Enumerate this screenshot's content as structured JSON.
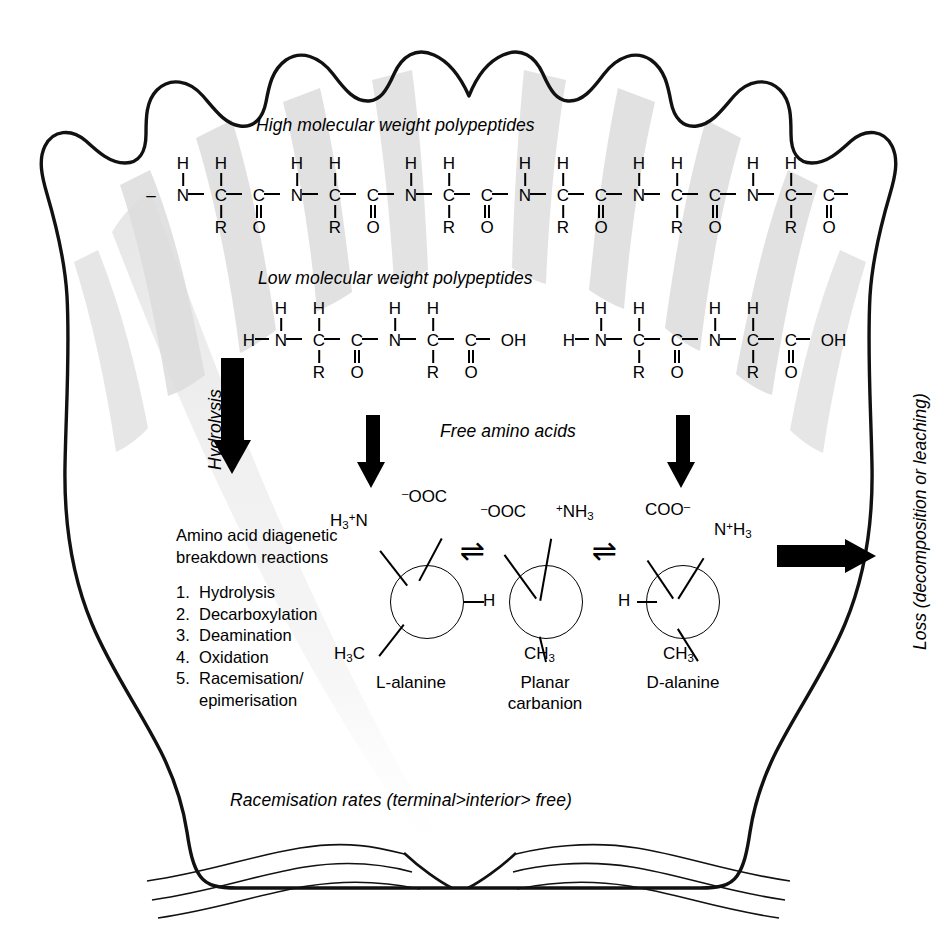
{
  "figure": {
    "title_caption_top": "High molecular weight polypeptides",
    "caption_low_mw": "Low molecular weight polypeptides",
    "caption_free_aa": "Free amino acids",
    "caption_racemisation": "Racemisation rates (terminal>interior> free)",
    "label_hydrolysis": "Hydrolysis",
    "label_loss": "Loss (decomposition or leaching)"
  },
  "reactions": {
    "heading_line1": "Amino acid diagenetic",
    "heading_line2": "breakdown reactions",
    "items": [
      {
        "num": "1.",
        "label": "Hydrolysis"
      },
      {
        "num": "2.",
        "label": "Decarboxylation"
      },
      {
        "num": "3.",
        "label": "Deamination"
      },
      {
        "num": "4.",
        "label": "Oxidation"
      },
      {
        "num": "5.",
        "label": "Racemisation/\nepimerisation"
      }
    ]
  },
  "atoms": {
    "H": "H",
    "N": "N",
    "C": "C",
    "O": "O",
    "R": "R",
    "OH": "OH",
    "dash": "–"
  },
  "structures": {
    "l_alanine": {
      "name": "L-alanine",
      "top_left_group": "H",
      "top_left_sub": "3",
      "top_left_sup": "+",
      "top_left_tail": "N",
      "top_right_sup": "–",
      "top_right_group": "OOC",
      "right_group": "H",
      "bottom_left_group": "H",
      "bottom_left_sub": "3",
      "bottom_left_tail": "C"
    },
    "planar_carbanion": {
      "name_line1": "Planar",
      "name_line2": "carbanion",
      "top_left_sup": "–",
      "top_left_group": "OOC",
      "top_right_sup": "+",
      "top_right_group": "NH",
      "top_right_sub": "3",
      "bottom_group": "CH",
      "bottom_sub": "3"
    },
    "d_alanine": {
      "name": "D-alanine",
      "top_left_group": "COO",
      "top_left_sup": "–",
      "top_right_group": "N",
      "top_right_sup": "+",
      "top_right_tail": "H",
      "top_right_sub": "3",
      "left_group": "H",
      "bottom_group": "CH",
      "bottom_sub": "3"
    },
    "equilibrium_symbol": "⇌"
  },
  "icons": {
    "arrow_down": "down-arrow",
    "arrow_right": "right-arrow",
    "equilibrium": "equilibrium-arrows"
  },
  "colors": {
    "ink": "#000000",
    "rib_shadow": "#d8d8d8",
    "background": "#ffffff"
  }
}
